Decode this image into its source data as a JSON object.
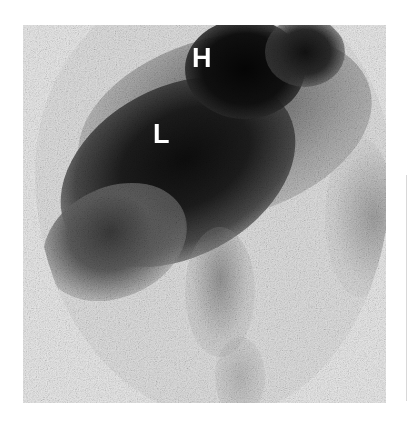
{
  "image": {
    "type": "nuclear-medicine-scintigraphy",
    "description": "Grayscale gamma camera scan with circular field of view showing dark uptake regions",
    "labels": [
      {
        "id": "heart",
        "text": "H"
      },
      {
        "id": "liver",
        "text": "L"
      }
    ],
    "colors": {
      "background": "#ffffff",
      "frame": "#e6e6e6",
      "uptake_dark": "#0d0d0d",
      "label_text": "#ffffff"
    }
  }
}
